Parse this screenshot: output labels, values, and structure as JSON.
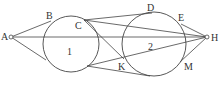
{
  "diagram": {
    "type": "geometry",
    "colors": {
      "stroke": "#444444",
      "text": "#333333",
      "background": "#ffffff"
    },
    "circles": [
      {
        "id": "1",
        "label": "1",
        "cx": 71,
        "cy": 44,
        "r": 28
      },
      {
        "id": "2",
        "label": "2",
        "cx": 154,
        "cy": 44,
        "r": 32
      }
    ],
    "points": {
      "A": {
        "label": "A",
        "x": 11,
        "y": 37
      },
      "B": {
        "label": "B",
        "x": 51,
        "y": 21
      },
      "C": {
        "label": "C",
        "x": 84,
        "y": 20
      },
      "D": {
        "label": "D",
        "x": 152,
        "y": 13
      },
      "E": {
        "label": "E",
        "x": 181,
        "y": 24
      },
      "H": {
        "label": "H",
        "x": 207,
        "y": 37
      },
      "K": {
        "label": "K",
        "x": 124,
        "y": 59
      },
      "M": {
        "label": "M",
        "x": 180,
        "y": 62
      },
      "P": {
        "label": "",
        "x": 87,
        "y": 66
      },
      "Q": {
        "label": "",
        "x": 46,
        "y": 58
      },
      "R": {
        "label": "",
        "x": 150,
        "y": 76
      }
    },
    "segments": [
      [
        "A",
        "B"
      ],
      [
        "A",
        "Q"
      ],
      [
        "A",
        "H"
      ],
      [
        "C",
        "D"
      ],
      [
        "C",
        "H"
      ],
      [
        "C",
        "K"
      ],
      [
        "P",
        "H"
      ],
      [
        "P",
        "R"
      ],
      [
        "K",
        "H"
      ],
      [
        "H",
        "E"
      ],
      [
        "H",
        "M"
      ]
    ],
    "labels": {
      "A": "A",
      "B": "B",
      "C": "C",
      "D": "D",
      "E": "E",
      "H": "H",
      "K": "K",
      "M": "M",
      "c1": "1",
      "c2": "2"
    }
  }
}
